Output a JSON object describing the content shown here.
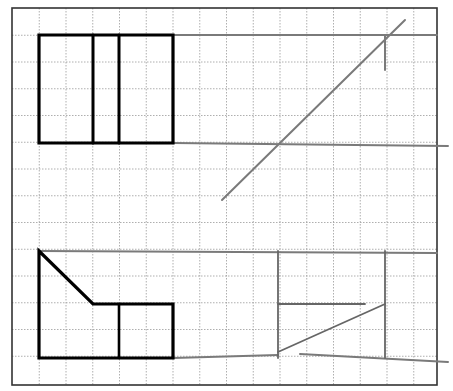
{
  "diagram": {
    "type": "orthographic-projection-exercise",
    "colors": {
      "background": "#ffffff",
      "grid": "#9a9a9a",
      "frame": "#333333",
      "object_lines": "#000000",
      "construction_lines": "#7a7a7a"
    },
    "grid": {
      "origin_x": 12.5,
      "origin_y": 8.5,
      "spacing": 26.75,
      "columns": 16,
      "rows": 14
    },
    "frame": {
      "x": 12,
      "y": 8,
      "width": 425,
      "height": 377
    },
    "views": {
      "top_view": {
        "label": "front-top view",
        "outline": [
          [
            39,
            35
          ],
          [
            173,
            35
          ],
          [
            173,
            143
          ],
          [
            39,
            143
          ]
        ],
        "inner_lines": [
          [
            [
              93,
              35
            ],
            [
              93,
              143
            ]
          ],
          [
            [
              119,
              35
            ],
            [
              119,
              143
            ]
          ]
        ]
      },
      "front_view": {
        "label": "front view",
        "outline": [
          [
            39,
            251
          ],
          [
            93,
            304
          ],
          [
            173,
            304
          ],
          [
            173,
            358
          ],
          [
            39,
            358
          ]
        ],
        "inner_lines": [
          [
            [
              119,
              304
            ],
            [
              119,
              358
            ]
          ]
        ]
      },
      "side_view": {
        "label": "side view construction",
        "lines": [
          [
            [
              278,
              251
            ],
            [
              278,
              358
            ]
          ],
          [
            [
              385,
              251
            ],
            [
              385,
              358
            ]
          ],
          [
            [
              278,
              304
            ],
            [
              365,
              304
            ]
          ],
          [
            [
              278,
              352
            ],
            [
              385,
              304
            ]
          ]
        ]
      }
    },
    "construction_lines": [
      [
        [
          173,
          35
        ],
        [
          437,
          35
        ]
      ],
      [
        [
          173,
          143
        ],
        [
          448,
          146
        ]
      ],
      [
        [
          222,
          200
        ],
        [
          405,
          20
        ]
      ],
      [
        [
          385,
          35
        ],
        [
          385,
          70
        ]
      ],
      [
        [
          39,
          251
        ],
        [
          437,
          253
        ]
      ],
      [
        [
          173,
          358
        ],
        [
          278,
          355
        ]
      ],
      [
        [
          300,
          354
        ],
        [
          448,
          362
        ]
      ]
    ]
  }
}
